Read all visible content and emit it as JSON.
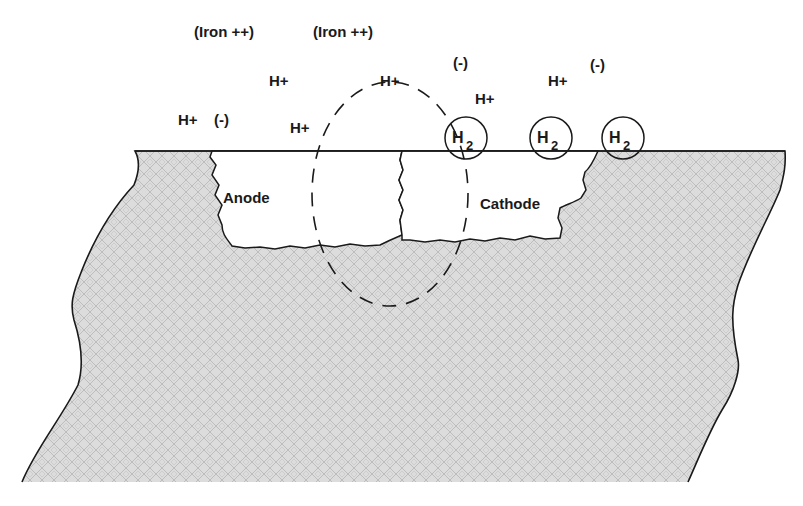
{
  "diagram": {
    "colors": {
      "metal_fill": "#d8d8d8",
      "metal_pattern": "#b8b8b8",
      "outline": "#1a1a1a",
      "pit_fill": "#ffffff",
      "text": "#1a1a1a"
    },
    "labels": {
      "iron_1": "(Iron ++)",
      "iron_2": "(Iron ++)",
      "hplus_1": "H+",
      "hplus_2": "H+",
      "hplus_3": "H+",
      "hplus_4": "H+",
      "hplus_5": "H+",
      "hplus_6": "H+",
      "minus_1": "(-)",
      "minus_2": "(-)",
      "minus_3": "(-)",
      "anode": "Anode",
      "cathode": "Cathode"
    },
    "bubbles": [
      {
        "main": "H",
        "sub": "2"
      },
      {
        "main": "H",
        "sub": "2"
      },
      {
        "main": "H",
        "sub": "2"
      }
    ]
  }
}
